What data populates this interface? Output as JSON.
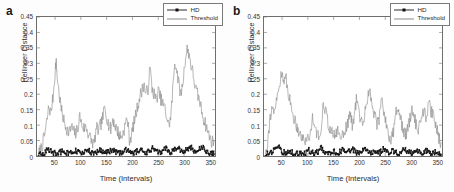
{
  "figure": {
    "background": "#ffffff",
    "panels": [
      {
        "label": "a",
        "xlabel": "Time (Intervals)",
        "ylabel": "Hellinger Distance",
        "legend": [
          {
            "name": "HD",
            "style": "line-marker",
            "color": "#2a2a2a"
          },
          {
            "name": "Threshold",
            "style": "line",
            "color": "#8a8a8a"
          }
        ],
        "yticks": [
          "0",
          "0.05",
          "0.1",
          "0.15",
          "0.2",
          "0.25",
          "0.3",
          "0.35",
          "0.4",
          "0.45"
        ],
        "xticks": [
          "50",
          "100",
          "150",
          "200",
          "250",
          "300",
          "350"
        ]
      },
      {
        "label": "b",
        "xlabel": "Time (Intervals)",
        "ylabel": "Hellinger Distance",
        "legend": [
          {
            "name": "HD",
            "style": "line-marker",
            "color": "#2a2a2a"
          },
          {
            "name": "Threshold",
            "style": "line",
            "color": "#8a8a8a"
          }
        ],
        "yticks": [
          "0",
          "0.05",
          "0.1",
          "0.15",
          "0.2",
          "0.25",
          "0.3",
          "0.35",
          "0.4",
          "0.45"
        ],
        "xticks": [
          "50",
          "100",
          "150",
          "200",
          "250",
          "300",
          "350"
        ]
      }
    ]
  },
  "chart_data": [
    {
      "type": "line",
      "panel": "a",
      "title": "",
      "xlabel": "Time (Intervals)",
      "ylabel": "Hellinger Distance",
      "xlim": [
        15,
        360
      ],
      "ylim": [
        0,
        0.45
      ],
      "grid": false,
      "legend_position": "top-right",
      "series": [
        {
          "name": "Threshold",
          "color": "#8a8a8a",
          "x": [
            18,
            22,
            26,
            30,
            34,
            38,
            42,
            46,
            50,
            52,
            54,
            58,
            62,
            66,
            70,
            74,
            78,
            82,
            86,
            90,
            94,
            98,
            102,
            106,
            110,
            114,
            118,
            122,
            126,
            130,
            134,
            138,
            142,
            146,
            150,
            154,
            158,
            162,
            166,
            170,
            174,
            178,
            182,
            186,
            190,
            194,
            198,
            202,
            206,
            210,
            214,
            218,
            222,
            226,
            230,
            234,
            238,
            242,
            246,
            250,
            254,
            258,
            262,
            266,
            270,
            274,
            278,
            282,
            286,
            290,
            294,
            298,
            302,
            306,
            310,
            314,
            318,
            322,
            326,
            330,
            334,
            338,
            342,
            346,
            350,
            354,
            358
          ],
          "y": [
            0.005,
            0.02,
            0.04,
            0.07,
            0.11,
            0.16,
            0.14,
            0.19,
            0.27,
            0.31,
            0.26,
            0.2,
            0.15,
            0.12,
            0.1,
            0.085,
            0.075,
            0.095,
            0.08,
            0.07,
            0.09,
            0.13,
            0.1,
            0.09,
            0.095,
            0.075,
            0.06,
            0.045,
            0.04,
            0.09,
            0.08,
            0.1,
            0.12,
            0.155,
            0.13,
            0.1,
            0.085,
            0.12,
            0.1,
            0.085,
            0.07,
            0.06,
            0.075,
            0.1,
            0.125,
            0.055,
            0.065,
            0.1,
            0.13,
            0.16,
            0.19,
            0.21,
            0.235,
            0.2,
            0.215,
            0.285,
            0.22,
            0.2,
            0.18,
            0.21,
            0.19,
            0.17,
            0.16,
            0.13,
            0.1,
            0.12,
            0.21,
            0.305,
            0.28,
            0.23,
            0.2,
            0.24,
            0.31,
            0.345,
            0.33,
            0.29,
            0.26,
            0.22,
            0.2,
            0.18,
            0.15,
            0.12,
            0.1,
            0.08,
            0.06,
            0.045,
            0.05
          ]
        },
        {
          "name": "HD",
          "color": "#111111",
          "x": [
            18,
            24,
            30,
            36,
            42,
            48,
            54,
            60,
            66,
            72,
            78,
            84,
            90,
            96,
            102,
            108,
            114,
            120,
            126,
            132,
            138,
            144,
            150,
            156,
            162,
            168,
            174,
            180,
            186,
            192,
            198,
            204,
            210,
            216,
            222,
            228,
            234,
            240,
            246,
            252,
            258,
            264,
            270,
            276,
            282,
            288,
            294,
            300,
            306,
            312,
            318,
            324,
            330,
            336,
            342,
            348,
            354,
            358
          ],
          "y": [
            0.004,
            0.006,
            0.012,
            0.02,
            0.014,
            0.01,
            0.008,
            0.012,
            0.018,
            0.01,
            0.008,
            0.012,
            0.016,
            0.011,
            0.009,
            0.013,
            0.019,
            0.011,
            0.009,
            0.014,
            0.02,
            0.012,
            0.01,
            0.016,
            0.021,
            0.013,
            0.009,
            0.013,
            0.018,
            0.022,
            0.012,
            0.01,
            0.017,
            0.023,
            0.013,
            0.011,
            0.019,
            0.026,
            0.014,
            0.011,
            0.018,
            0.025,
            0.015,
            0.012,
            0.021,
            0.03,
            0.016,
            0.013,
            0.022,
            0.031,
            0.017,
            0.013,
            0.021,
            0.028,
            0.015,
            0.011,
            0.008,
            0.006
          ]
        }
      ]
    },
    {
      "type": "line",
      "panel": "b",
      "title": "",
      "xlabel": "Time (Intervals)",
      "ylabel": "Hellinger Distance",
      "xlim": [
        15,
        360
      ],
      "ylim": [
        0,
        0.45
      ],
      "grid": false,
      "legend_position": "top-right",
      "series": [
        {
          "name": "Threshold",
          "color": "#8a8a8a",
          "x": [
            18,
            22,
            26,
            30,
            34,
            38,
            42,
            46,
            50,
            54,
            58,
            62,
            66,
            70,
            74,
            78,
            82,
            86,
            90,
            94,
            98,
            102,
            106,
            110,
            114,
            118,
            122,
            126,
            130,
            134,
            138,
            142,
            146,
            150,
            154,
            158,
            162,
            166,
            170,
            174,
            178,
            182,
            186,
            190,
            194,
            198,
            202,
            206,
            210,
            214,
            218,
            222,
            226,
            230,
            234,
            238,
            242,
            246,
            250,
            254,
            258,
            262,
            266,
            270,
            274,
            278,
            282,
            286,
            290,
            294,
            298,
            302,
            306,
            310,
            314,
            318,
            322,
            326,
            330,
            334,
            338,
            342,
            346,
            350,
            354,
            358
          ],
          "y": [
            0.01,
            0.05,
            0.11,
            0.16,
            0.13,
            0.17,
            0.2,
            0.24,
            0.28,
            0.23,
            0.25,
            0.21,
            0.17,
            0.14,
            0.12,
            0.1,
            0.085,
            0.07,
            0.055,
            0.05,
            0.06,
            0.05,
            0.09,
            0.13,
            0.1,
            0.07,
            0.055,
            0.09,
            0.18,
            0.15,
            0.12,
            0.09,
            0.075,
            0.065,
            0.07,
            0.085,
            0.06,
            0.07,
            0.08,
            0.09,
            0.11,
            0.14,
            0.1,
            0.13,
            0.18,
            0.155,
            0.12,
            0.1,
            0.135,
            0.175,
            0.215,
            0.19,
            0.16,
            0.13,
            0.1,
            0.12,
            0.19,
            0.16,
            0.12,
            0.09,
            0.06,
            0.05,
            0.08,
            0.13,
            0.17,
            0.14,
            0.1,
            0.08,
            0.07,
            0.09,
            0.12,
            0.16,
            0.13,
            0.1,
            0.08,
            0.11,
            0.15,
            0.14,
            0.12,
            0.17,
            0.15,
            0.13,
            0.11,
            0.09,
            0.06,
            0.045
          ]
        },
        {
          "name": "HD",
          "color": "#111111",
          "x": [
            18,
            24,
            30,
            36,
            42,
            48,
            54,
            60,
            66,
            72,
            78,
            84,
            90,
            96,
            102,
            108,
            114,
            120,
            126,
            132,
            138,
            144,
            150,
            156,
            162,
            168,
            174,
            180,
            186,
            192,
            198,
            204,
            210,
            216,
            222,
            228,
            234,
            240,
            246,
            252,
            258,
            264,
            270,
            276,
            282,
            288,
            294,
            300,
            306,
            312,
            318,
            324,
            330,
            336,
            342,
            348,
            354,
            358
          ],
          "y": [
            0.004,
            0.008,
            0.012,
            0.02,
            0.035,
            0.016,
            0.012,
            0.009,
            0.014,
            0.01,
            0.007,
            0.009,
            0.012,
            0.008,
            0.019,
            0.011,
            0.009,
            0.013,
            0.026,
            0.012,
            0.009,
            0.011,
            0.016,
            0.01,
            0.013,
            0.02,
            0.011,
            0.014,
            0.023,
            0.013,
            0.01,
            0.015,
            0.021,
            0.012,
            0.01,
            0.014,
            0.018,
            0.011,
            0.024,
            0.013,
            0.01,
            0.016,
            0.012,
            0.009,
            0.017,
            0.022,
            0.012,
            0.01,
            0.015,
            0.019,
            0.011,
            0.013,
            0.018,
            0.012,
            0.009,
            0.012,
            0.008,
            0.005
          ]
        }
      ]
    }
  ]
}
